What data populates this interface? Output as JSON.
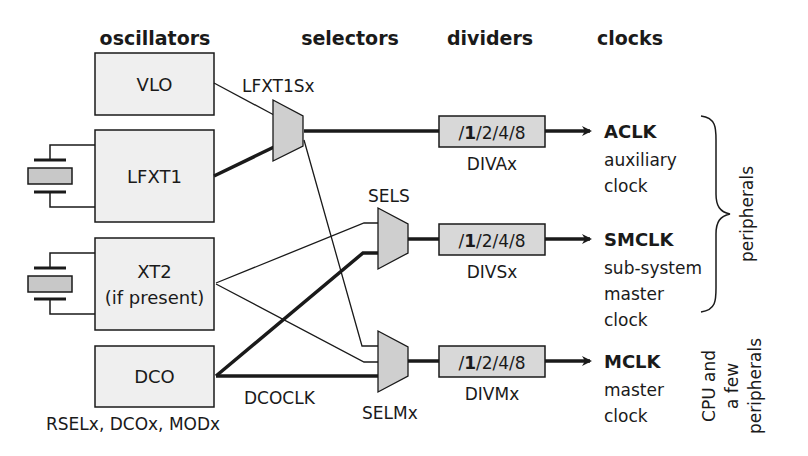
{
  "headers": {
    "oscillators": "oscillators",
    "selectors": "selectors",
    "dividers": "dividers",
    "clocks": "clocks"
  },
  "oscillators": [
    {
      "id": "vlo",
      "label": "VLO",
      "has_crystal": false
    },
    {
      "id": "lfxt1",
      "label": "LFXT1",
      "has_crystal": true
    },
    {
      "id": "xt2",
      "label": "XT2",
      "sublabel": "(if present)",
      "has_crystal": true
    },
    {
      "id": "dco",
      "label": "DCO",
      "has_crystal": false,
      "control_bits": "RSELx, DCOx, MODx"
    }
  ],
  "selectors": [
    {
      "id": "lfxt1sx",
      "label": "LFXT1Sx"
    },
    {
      "id": "sels",
      "label": "SELS"
    },
    {
      "id": "selmx",
      "label": "SELMx"
    }
  ],
  "signals": {
    "dcoclk": "DCOCLK"
  },
  "dividers": [
    {
      "id": "diva",
      "prefix": "/",
      "bold_value": "1",
      "rest": "/2/4/8",
      "label": "DIVAx"
    },
    {
      "id": "divs",
      "prefix": "/",
      "bold_value": "1",
      "rest": "/2/4/8",
      "label": "DIVSx"
    },
    {
      "id": "divm",
      "prefix": "/",
      "bold_value": "1",
      "rest": "/2/4/8",
      "label": "DIVMx"
    }
  ],
  "clocks": [
    {
      "id": "aclk",
      "name": "ACLK",
      "desc": [
        "auxiliary",
        "clock"
      ]
    },
    {
      "id": "smclk",
      "name": "SMCLK",
      "desc": [
        "sub-system",
        "master",
        "clock"
      ]
    },
    {
      "id": "mclk",
      "name": "MCLK",
      "desc": [
        "master",
        "clock"
      ]
    }
  ],
  "destinations": {
    "peripherals": "peripherals",
    "cpu": [
      "CPU and",
      "a few",
      "peripherals"
    ]
  },
  "colors": {
    "box_fill": "#efefef",
    "mux_fill": "#cfcfcf",
    "divider_fill": "#d8d8d8",
    "crystal_fill": "#c8c8c8",
    "line": "#1a1a1a"
  }
}
